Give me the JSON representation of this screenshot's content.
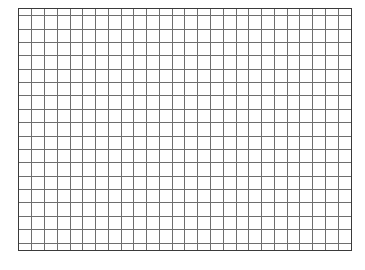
{
  "page": {
    "background_color": "#ffffff",
    "width": 365,
    "height": 270
  },
  "grid": {
    "name": "blank-grid-sheet",
    "description": "Empty graph-paper style grid of blank cells",
    "columns": 26,
    "rows": 19,
    "cell_width_px": 12.85,
    "cell_height_px": 12.8,
    "origin_x_px": 18,
    "origin_y_px": 8,
    "width_px": 334,
    "height_px": 243,
    "line_color": "#6e6e6e",
    "border_color": "#3a3a3a",
    "border_width_px": 1.5,
    "cell_fill_color": "#ffffff",
    "cell_text": "",
    "has_headers": false,
    "has_labels": false
  }
}
